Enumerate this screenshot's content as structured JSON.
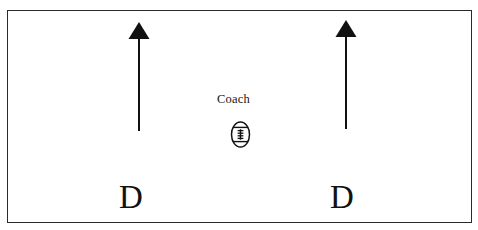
{
  "diagram": {
    "type": "football-drill-diagram",
    "background_color": "#ffffff",
    "border_color": "#2b2b2f",
    "ink_color": "#121212",
    "field": {
      "label": "field-boundary",
      "x": 7,
      "y": 10,
      "width": 465,
      "height": 213
    },
    "coach": {
      "label": "Coach",
      "x": 217,
      "y": 93
    },
    "ball": {
      "icon": "football-icon",
      "center_x": 240,
      "center_y": 134,
      "width": 21,
      "height": 27
    },
    "players": [
      {
        "label": "D",
        "x": 119,
        "y": 181
      },
      {
        "label": "D",
        "x": 330,
        "y": 181
      }
    ],
    "arrows": [
      {
        "name": "left-run-arrow",
        "direction": "up",
        "x": 139,
        "tail_y": 131,
        "head_y": 22,
        "head_width": 21,
        "head_height": 17,
        "shaft_width": 2
      },
      {
        "name": "right-run-arrow",
        "direction": "up",
        "x": 346,
        "tail_y": 129,
        "head_y": 20,
        "head_width": 21,
        "head_height": 17,
        "shaft_width": 2
      }
    ]
  },
  "chart_data": {
    "type": "diagram",
    "xlabel": "",
    "ylabel": "",
    "annotations": [
      "Coach",
      "D",
      "D"
    ],
    "elements": [
      {
        "kind": "boundary",
        "shape": "rectangle"
      },
      {
        "kind": "text",
        "value": "Coach"
      },
      {
        "kind": "icon",
        "value": "football"
      },
      {
        "kind": "arrow",
        "value": "up",
        "position": "left"
      },
      {
        "kind": "arrow",
        "value": "up",
        "position": "right"
      },
      {
        "kind": "text",
        "value": "D",
        "position": "left"
      },
      {
        "kind": "text",
        "value": "D",
        "position": "right"
      }
    ]
  }
}
